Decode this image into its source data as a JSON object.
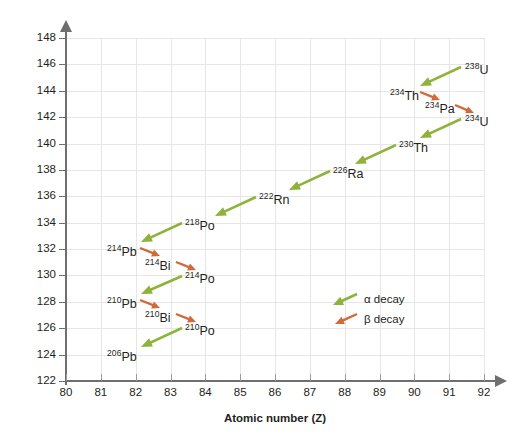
{
  "chart_data": {
    "type": "scatter",
    "title": "",
    "xlabel": "Atomic number (Z)",
    "ylabel": "Number of neutrons (n)",
    "xlim": [
      80,
      92
    ],
    "ylim": [
      122,
      148
    ],
    "xticks": [
      80,
      81,
      82,
      83,
      84,
      85,
      86,
      87,
      88,
      89,
      90,
      91,
      92
    ],
    "yticks": [
      122,
      124,
      126,
      128,
      130,
      132,
      134,
      136,
      138,
      140,
      142,
      144,
      146,
      148
    ],
    "grid": true,
    "legend_position": "inside-right",
    "legend": [
      {
        "name": "alpha_decay",
        "label": "α decay",
        "color": "#8db33a"
      },
      {
        "name": "beta_decay",
        "label": "β decay",
        "color": "#d2693a"
      }
    ],
    "nuclides": [
      {
        "id": "U238",
        "mass": "238",
        "symbol": "U",
        "z": 92,
        "n": 146,
        "label_x": 465,
        "label_y": 62
      },
      {
        "id": "Th234",
        "mass": "234",
        "symbol": "Th",
        "z": 90,
        "n": 144,
        "label_x": 390,
        "label_y": 88
      },
      {
        "id": "Pa234",
        "mass": "234",
        "symbol": "Pa",
        "z": 91,
        "n": 143,
        "label_x": 425,
        "label_y": 101
      },
      {
        "id": "U234",
        "mass": "234",
        "symbol": "U",
        "z": 92,
        "n": 142,
        "label_x": 465,
        "label_y": 114
      },
      {
        "id": "Th230",
        "mass": "230",
        "symbol": "Th",
        "z": 90,
        "n": 140,
        "label_x": 399,
        "label_y": 140
      },
      {
        "id": "Ra226",
        "mass": "226",
        "symbol": "Ra",
        "z": 88,
        "n": 138,
        "label_x": 333,
        "label_y": 166
      },
      {
        "id": "Rn222",
        "mass": "222",
        "symbol": "Rn",
        "z": 86,
        "n": 136,
        "label_x": 259,
        "label_y": 192
      },
      {
        "id": "Po218",
        "mass": "218",
        "symbol": "Po",
        "z": 84,
        "n": 134,
        "label_x": 185,
        "label_y": 218
      },
      {
        "id": "Pb214",
        "mass": "214",
        "symbol": "Pb",
        "z": 82,
        "n": 132,
        "label_x": 107,
        "label_y": 244
      },
      {
        "id": "Bi214",
        "mass": "214",
        "symbol": "Bi",
        "z": 83,
        "n": 131,
        "label_x": 145,
        "label_y": 258
      },
      {
        "id": "Po214",
        "mass": "214",
        "symbol": "Po",
        "z": 84,
        "n": 130,
        "label_x": 185,
        "label_y": 271
      },
      {
        "id": "Pb210",
        "mass": "210",
        "symbol": "Pb",
        "z": 82,
        "n": 128,
        "label_x": 107,
        "label_y": 296
      },
      {
        "id": "Bi210",
        "mass": "210",
        "symbol": "Bi",
        "z": 83,
        "n": 127,
        "label_x": 145,
        "label_y": 310
      },
      {
        "id": "Po210",
        "mass": "210",
        "symbol": "Po",
        "z": 84,
        "n": 126,
        "label_x": 185,
        "label_y": 323
      },
      {
        "id": "Pb206",
        "mass": "206",
        "symbol": "Pb",
        "z": 82,
        "n": 124,
        "label_x": 107,
        "label_y": 349
      }
    ],
    "decays": [
      {
        "from": "U238",
        "to": "Th234",
        "type": "alpha",
        "x1": 461,
        "y1": 67,
        "x2": 420,
        "y2": 86
      },
      {
        "from": "Th234",
        "to": "Pa234",
        "type": "beta",
        "x1": 420,
        "y1": 92,
        "x2": 440,
        "y2": 100
      },
      {
        "from": "Pa234",
        "to": "U234",
        "type": "beta",
        "x1": 455,
        "y1": 105,
        "x2": 474,
        "y2": 113
      },
      {
        "from": "U234",
        "to": "Th230",
        "type": "alpha",
        "x1": 461,
        "y1": 119,
        "x2": 420,
        "y2": 138
      },
      {
        "from": "Th230",
        "to": "Ra226",
        "type": "alpha",
        "x1": 396,
        "y1": 145,
        "x2": 355,
        "y2": 164
      },
      {
        "from": "Ra226",
        "to": "Rn222",
        "type": "alpha",
        "x1": 330,
        "y1": 171,
        "x2": 289,
        "y2": 190
      },
      {
        "from": "Rn222",
        "to": "Po218",
        "type": "alpha",
        "x1": 256,
        "y1": 197,
        "x2": 215,
        "y2": 216
      },
      {
        "from": "Po218",
        "to": "Pb214",
        "type": "alpha",
        "x1": 182,
        "y1": 223,
        "x2": 141,
        "y2": 242
      },
      {
        "from": "Pb214",
        "to": "Bi214",
        "type": "beta",
        "x1": 140,
        "y1": 248,
        "x2": 160,
        "y2": 256
      },
      {
        "from": "Bi214",
        "to": "Po214",
        "type": "beta",
        "x1": 176,
        "y1": 262,
        "x2": 196,
        "y2": 270
      },
      {
        "from": "Po214",
        "to": "Pb210",
        "type": "alpha",
        "x1": 182,
        "y1": 276,
        "x2": 141,
        "y2": 294
      },
      {
        "from": "Pb210",
        "to": "Bi210",
        "type": "beta",
        "x1": 140,
        "y1": 300,
        "x2": 160,
        "y2": 308
      },
      {
        "from": "Bi210",
        "to": "Po210",
        "type": "beta",
        "x1": 176,
        "y1": 314,
        "x2": 196,
        "y2": 322
      },
      {
        "from": "Po210",
        "to": "Pb206",
        "type": "alpha",
        "x1": 182,
        "y1": 328,
        "x2": 141,
        "y2": 347
      }
    ]
  },
  "axes": {
    "x_title": "Atomic number (Z)",
    "y_title": "Number of neutrons (n)"
  },
  "colors": {
    "alpha": "#8db33a",
    "beta": "#d2693a",
    "grid": "#e6e6e6",
    "axis": "#6f6f6f",
    "text": "#231f20"
  }
}
